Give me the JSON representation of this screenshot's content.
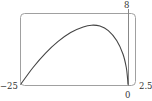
{
  "chart_data": {
    "type": "line",
    "title": "",
    "xlabel": "",
    "ylabel": "",
    "xlim": [
      -25,
      2.5
    ],
    "ylim": [
      0,
      8
    ],
    "grid": false,
    "legend": null,
    "tick_labels": {
      "x_min": "−25",
      "x_origin": "0",
      "x_max": "2.5",
      "y_max": "8"
    },
    "series": [
      {
        "name": "curve",
        "color": "#444444",
        "points": [
          {
            "x": -25,
            "y": 0.1
          },
          {
            "x": -22,
            "y": 2.0
          },
          {
            "x": -19,
            "y": 3.6
          },
          {
            "x": -16,
            "y": 4.9
          },
          {
            "x": -13,
            "y": 5.9
          },
          {
            "x": -10,
            "y": 6.5
          },
          {
            "x": -8,
            "y": 6.7
          },
          {
            "x": -6,
            "y": 6.6
          },
          {
            "x": -4,
            "y": 6.1
          },
          {
            "x": -2,
            "y": 5.0
          },
          {
            "x": -0.5,
            "y": 3.5
          },
          {
            "x": 0.3,
            "y": 2.0
          },
          {
            "x": 0.6,
            "y": 0.8
          },
          {
            "x": 0.7,
            "y": 0.1
          }
        ]
      }
    ]
  },
  "colors": {
    "frame": "#999999",
    "axis": "#888888",
    "curve": "#444444",
    "text": "#333333"
  }
}
